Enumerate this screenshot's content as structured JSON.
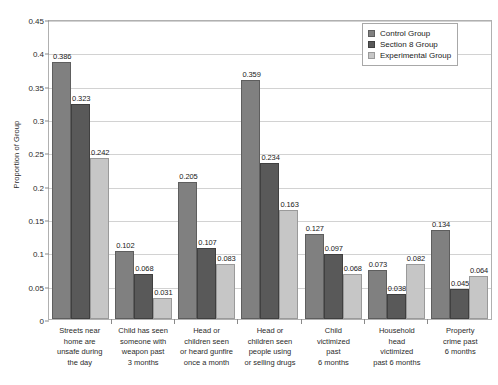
{
  "chart_data": {
    "type": "bar",
    "title": "",
    "xlabel": "",
    "ylabel": "Proportion of Group",
    "ylim": [
      0,
      0.45
    ],
    "ytick_step": 0.05,
    "yticks": [
      "0",
      "0.05",
      "0.1",
      "0.15",
      "0.2",
      "0.25",
      "0.3",
      "0.35",
      "0.4",
      "0.45"
    ],
    "grid": "horizontal",
    "legend_position": "top-right",
    "categories": [
      "Streets near home are unsafe during the day",
      "Child has seen someone with weapon past 3 months",
      "Head or children seen or heard gunfire once a month",
      "Head or children seen people using or selling drugs",
      "Child victimized past 6 months",
      "Household head victimized past 6 months",
      "Property crime past 6 months"
    ],
    "series": [
      {
        "name": "Control Group",
        "color": "#808080",
        "values": [
          0.386,
          0.102,
          0.205,
          0.359,
          0.127,
          0.073,
          0.134
        ],
        "labels": [
          "0.386",
          "0.102",
          "0.205",
          "0.359",
          "0.127",
          "0.073",
          "0.134"
        ]
      },
      {
        "name": "Section 8 Group",
        "color": "#595959",
        "values": [
          0.323,
          0.068,
          0.107,
          0.234,
          0.097,
          0.038,
          0.045
        ],
        "labels": [
          "0.323",
          "0.068",
          "0.107",
          "0.234",
          "0.097",
          "0.038",
          "0.045"
        ]
      },
      {
        "name": "Experimental Group",
        "color": "#c6c6c6",
        "values": [
          0.242,
          0.031,
          0.083,
          0.163,
          0.068,
          0.082,
          0.064
        ],
        "labels": [
          "0.242",
          "0.031",
          "0.083",
          "0.163",
          "0.068",
          "0.082",
          "0.064"
        ]
      }
    ]
  },
  "legend": {
    "items": [
      {
        "label": "Control Group"
      },
      {
        "label": "Section 8 Group"
      },
      {
        "label": "Experimental Group"
      }
    ]
  },
  "axis": {
    "y_title": "Proportion of Group"
  },
  "x_labels": [
    [
      "Streets near",
      "home are",
      "unsafe during",
      "the day"
    ],
    [
      "Child has seen",
      "someone with",
      "weapon past",
      "3 months"
    ],
    [
      "Head or",
      "children seen",
      "or heard gunfire",
      "once a month"
    ],
    [
      "Head or",
      "children seen",
      "people using",
      "or selling drugs"
    ],
    [
      "Child",
      "victimized",
      "past",
      "6 months"
    ],
    [
      "Household",
      "head",
      "victimized",
      "past 6 months"
    ],
    [
      "Property",
      "crime past",
      "6 months"
    ]
  ]
}
